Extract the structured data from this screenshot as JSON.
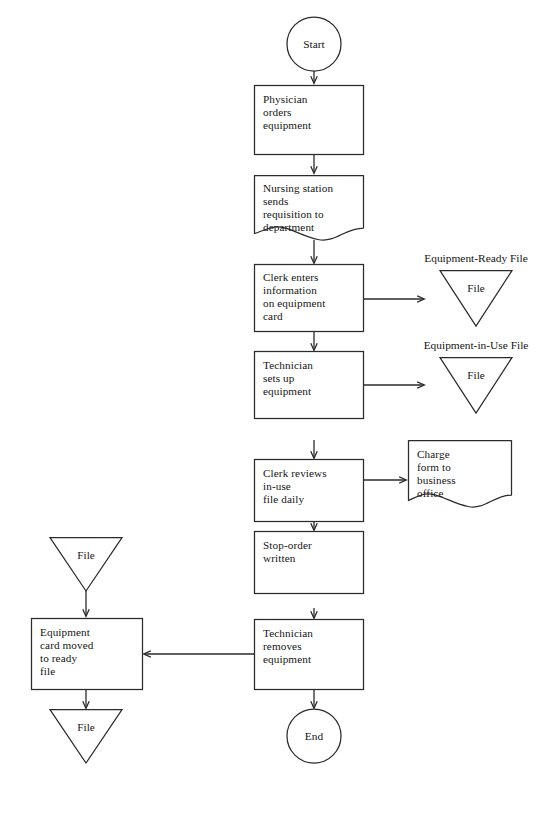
{
  "diagram": {
    "background_color": "#ffffff",
    "line_color": "#2b2b2b",
    "text_color": "#151515"
  },
  "nodes": {
    "start": {
      "label": "Start",
      "shape": "circle"
    },
    "physician": {
      "line1": "Physician",
      "line2": "orders",
      "line3": "equipment",
      "shape": "process"
    },
    "nursing": {
      "line1": "Nursing station",
      "line2": "sends",
      "line3": "requisition to",
      "line4": "department",
      "shape": "document"
    },
    "clerk_enters": {
      "line1": "Clerk enters",
      "line2": "information",
      "line3": "on equipment",
      "line4": "card",
      "shape": "process"
    },
    "technician_sets": {
      "line1": "Technician",
      "line2": "sets up",
      "line3": "equipment",
      "shape": "process"
    },
    "clerk_reviews": {
      "line1": "Clerk reviews",
      "line2": "in-use",
      "line3": "file daily",
      "shape": "process"
    },
    "stop_order": {
      "line1": "Stop-order",
      "line2": "written",
      "shape": "process"
    },
    "technician_removes": {
      "line1": "Technician",
      "line2": "removes",
      "line3": "equipment",
      "shape": "process"
    },
    "equipment_card_moved": {
      "line1": "Equipment",
      "line2": "card moved",
      "line3": "to ready",
      "line4": "file",
      "shape": "process"
    },
    "charge_form": {
      "line1": "Charge",
      "line2": "form to",
      "line3": "business",
      "line4": "office",
      "shape": "document"
    },
    "end": {
      "label": "End",
      "shape": "circle"
    }
  },
  "files": {
    "equipment_ready": {
      "caption": "Equipment-Ready File",
      "label": "File",
      "shape": "triangle"
    },
    "equipment_in_use": {
      "caption": "Equipment-in-Use File",
      "label": "File",
      "shape": "triangle"
    },
    "ready_file_source": {
      "label": "File",
      "shape": "triangle"
    },
    "ready_file_target": {
      "label": "File",
      "shape": "triangle"
    }
  },
  "connectors": [
    {
      "from": "start",
      "to": "physician",
      "direction": "down"
    },
    {
      "from": "physician",
      "to": "nursing",
      "direction": "down"
    },
    {
      "from": "nursing",
      "to": "clerk_enters",
      "direction": "down"
    },
    {
      "from": "clerk_enters",
      "to": "equipment_ready",
      "direction": "right"
    },
    {
      "from": "clerk_enters",
      "to": "technician_sets",
      "direction": "down"
    },
    {
      "from": "technician_sets",
      "to": "equipment_in_use",
      "direction": "right"
    },
    {
      "from": "technician_sets",
      "to": "clerk_reviews",
      "direction": "down"
    },
    {
      "from": "clerk_reviews",
      "to": "charge_form",
      "direction": "right"
    },
    {
      "from": "clerk_reviews",
      "to": "stop_order",
      "direction": "down"
    },
    {
      "from": "stop_order",
      "to": "technician_removes",
      "direction": "down"
    },
    {
      "from": "technician_removes",
      "to": "equipment_card_moved",
      "direction": "left"
    },
    {
      "from": "technician_removes",
      "to": "end",
      "direction": "down"
    },
    {
      "from": "ready_file_source",
      "to": "equipment_card_moved",
      "direction": "down"
    },
    {
      "from": "equipment_card_moved",
      "to": "ready_file_target",
      "direction": "down"
    }
  ]
}
